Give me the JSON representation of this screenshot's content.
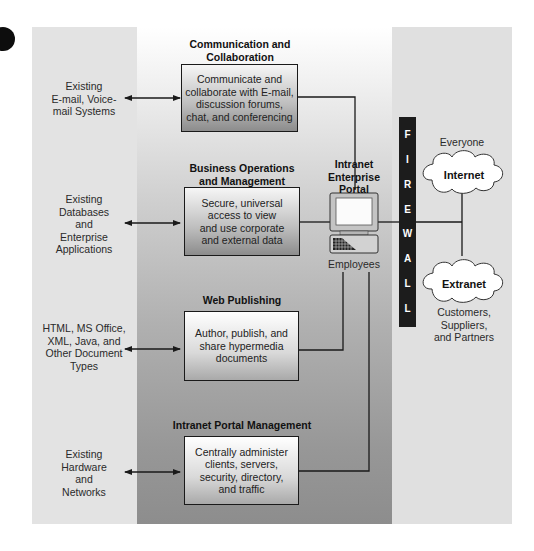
{
  "diagram": {
    "colors": {
      "left_panel": "#e3e3e3",
      "center_top": "#ffffff",
      "center_bottom": "#8d8d8d",
      "right_panel": "#e0e0e0",
      "firewall": "#1c1c1c",
      "line": "#1a1a1a"
    },
    "sources": [
      {
        "label": "Existing E-mail, Voice-mail Systems",
        "lines": [
          "Existing",
          "E-mail, Voice-",
          "mail Systems"
        ]
      },
      {
        "label": "Existing Databases and Enterprise Applications",
        "lines": [
          "Existing",
          "Databases",
          "and",
          "Enterprise",
          "Applications"
        ]
      },
      {
        "label": "HTML, MS Office, XML, Java, and Other Document Types",
        "lines": [
          "HTML, MS Office,",
          "XML, Java, and",
          "Other Document",
          "Types"
        ]
      },
      {
        "label": "Existing Hardware and Networks",
        "lines": [
          "Existing",
          "Hardware",
          "and",
          "Networks"
        ]
      }
    ],
    "functions": [
      {
        "title_lines": [
          "Communication and",
          "Collaboration"
        ],
        "body_lines": [
          "Communicate and",
          "collaborate with E-mail,",
          "discussion forums,",
          "chat, and conferencing"
        ]
      },
      {
        "title_lines": [
          "Business Operations",
          "and Management"
        ],
        "body_lines": [
          "Secure, universal",
          "access to view",
          "and use corporate",
          "and external data"
        ]
      },
      {
        "title_lines": [
          "Web Publishing"
        ],
        "body_lines": [
          "Author, publish, and",
          "share hypermedia",
          "documents"
        ]
      },
      {
        "title_lines": [
          "Intranet Portal Management"
        ],
        "body_lines": [
          "Centrally administer",
          "clients, servers,",
          "security, directory,",
          "and traffic"
        ]
      }
    ],
    "portal": {
      "title_lines": [
        "Intranet",
        "Enterprise",
        "Portal"
      ],
      "users_label": "Employees"
    },
    "firewall": {
      "letters": [
        "F",
        "I",
        "R",
        "E",
        "W",
        "A",
        "L",
        "L"
      ]
    },
    "networks": [
      {
        "name": "Internet",
        "audience_lines": [
          "Everyone"
        ]
      },
      {
        "name": "Extranet",
        "audience_lines": [
          "Customers,",
          "Suppliers,",
          "and Partners"
        ]
      }
    ]
  }
}
